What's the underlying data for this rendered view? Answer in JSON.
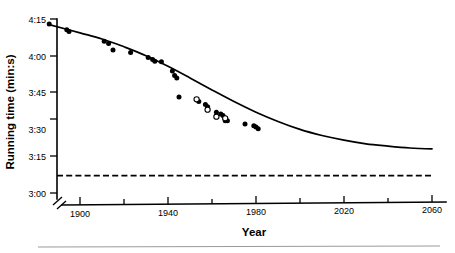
{
  "figure": {
    "background_color": "#ffffff",
    "ink_color": "#000000",
    "footer_rule_color": "#9a9a9a"
  },
  "chart_data": {
    "type": "scatter",
    "title": "",
    "xlabel": "Year",
    "ylabel": "Running time (min:s)",
    "xlim": [
      1886,
      2060
    ],
    "ylim_seconds": [
      180,
      255
    ],
    "ylim_labels": [
      "3:00",
      "4:15"
    ],
    "grid": false,
    "legend_position": "none",
    "axis_break": true,
    "x_ticks_major": [
      1900,
      1940,
      1980,
      2020,
      2060
    ],
    "x_ticks_major_labels": [
      "1900",
      "1940",
      "1980",
      "2020",
      "2060"
    ],
    "x_ticks_minor": [
      1920,
      1960,
      2000,
      2040
    ],
    "y_ticks_seconds": [
      255,
      240,
      225,
      210,
      195,
      180
    ],
    "y_ticks_labels": [
      "4:15",
      "4:00",
      "3:45",
      "3:30",
      "3:15",
      "3:00"
    ],
    "series": [
      {
        "name": "Men's mile world records (filled circles)",
        "marker": "filled-circle",
        "points": [
          {
            "x": 1886,
            "y_seconds": 252.8
          },
          {
            "x": 1894,
            "y_seconds": 250.4
          },
          {
            "x": 1895,
            "y_seconds": 249.6
          },
          {
            "x": 1911,
            "y_seconds": 245.4
          },
          {
            "x": 1913,
            "y_seconds": 244.5
          },
          {
            "x": 1915,
            "y_seconds": 241.6
          },
          {
            "x": 1923,
            "y_seconds": 240.6
          },
          {
            "x": 1931,
            "y_seconds": 238.4
          },
          {
            "x": 1933,
            "y_seconds": 237.6
          },
          {
            "x": 1934,
            "y_seconds": 236.8
          },
          {
            "x": 1937,
            "y_seconds": 236.6
          },
          {
            "x": 1942,
            "y_seconds": 232.6
          },
          {
            "x": 1943,
            "y_seconds": 230.6
          },
          {
            "x": 1944,
            "y_seconds": 229.6
          },
          {
            "x": 1945,
            "y_seconds": 221.4
          },
          {
            "x": 1954,
            "y_seconds": 219.4
          },
          {
            "x": 1957,
            "y_seconds": 218.2
          },
          {
            "x": 1958,
            "y_seconds": 217.2
          },
          {
            "x": 1962,
            "y_seconds": 214.8
          },
          {
            "x": 1964,
            "y_seconds": 214.1
          },
          {
            "x": 1965,
            "y_seconds": 213.4
          },
          {
            "x": 1966,
            "y_seconds": 211.1
          },
          {
            "x": 1967,
            "y_seconds": 211.1
          },
          {
            "x": 1975,
            "y_seconds": 209.7
          },
          {
            "x": 1979,
            "y_seconds": 209.0
          },
          {
            "x": 1980,
            "y_seconds": 208.4
          },
          {
            "x": 1981,
            "y_seconds": 207.7
          }
        ]
      },
      {
        "name": "Selected records (open circles)",
        "marker": "open-circle",
        "points": [
          {
            "x": 1953,
            "y_seconds": 220.4
          },
          {
            "x": 1958,
            "y_seconds": 215.9
          },
          {
            "x": 1962,
            "y_seconds": 212.9
          },
          {
            "x": 1966,
            "y_seconds": 212.2
          }
        ]
      }
    ],
    "fit_curve": {
      "name": "Exponential decay fit / projection",
      "style": "solid",
      "points": [
        {
          "x": 1886,
          "y_seconds": 252.6
        },
        {
          "x": 1900,
          "y_seconds": 249.0
        },
        {
          "x": 1910,
          "y_seconds": 246.4
        },
        {
          "x": 1920,
          "y_seconds": 243.0
        },
        {
          "x": 1930,
          "y_seconds": 239.2
        },
        {
          "x": 1940,
          "y_seconds": 234.6
        },
        {
          "x": 1950,
          "y_seconds": 229.6
        },
        {
          "x": 1960,
          "y_seconds": 224.4
        },
        {
          "x": 1970,
          "y_seconds": 219.4
        },
        {
          "x": 1980,
          "y_seconds": 214.8
        },
        {
          "x": 1990,
          "y_seconds": 210.8
        },
        {
          "x": 2000,
          "y_seconds": 207.4
        },
        {
          "x": 2010,
          "y_seconds": 204.8
        },
        {
          "x": 2020,
          "y_seconds": 202.8
        },
        {
          "x": 2030,
          "y_seconds": 201.2
        },
        {
          "x": 2040,
          "y_seconds": 200.2
        },
        {
          "x": 2050,
          "y_seconds": 199.4
        },
        {
          "x": 2060,
          "y_seconds": 199.0
        }
      ]
    },
    "asymptote_line": {
      "name": "Predicted limiting running time",
      "style": "dashed",
      "y_seconds": 187.5,
      "x_from": 1886,
      "x_to": 2060
    }
  }
}
